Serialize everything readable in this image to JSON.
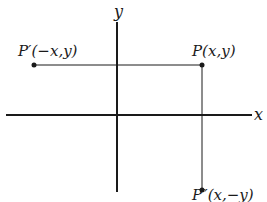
{
  "diagram": {
    "axes": {
      "x_label": "x",
      "y_label": "y"
    },
    "points": {
      "p": {
        "label": "P(x,y)"
      },
      "p_prime": {
        "label": "P′(−x,y)"
      },
      "p_double_prime": {
        "label": "P″(x,−y)"
      }
    },
    "colors": {
      "ink": "#1a1a1a",
      "background": "#ffffff"
    }
  }
}
